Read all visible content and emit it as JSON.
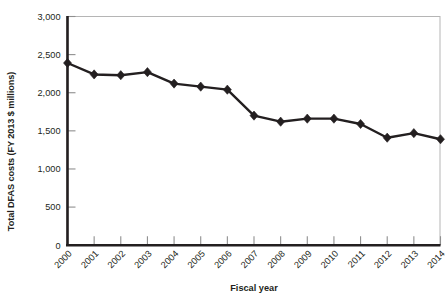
{
  "chart_data": {
    "type": "line",
    "title": "",
    "xlabel": "Fiscal year",
    "ylabel": "Total DFAS costs (FY 2013 $ millions)",
    "categories": [
      "2000",
      "2001",
      "2002",
      "2003",
      "2004",
      "2005",
      "2006",
      "2007",
      "2008",
      "2009",
      "2010",
      "2011",
      "2012",
      "2013",
      "2014"
    ],
    "values": [
      2390,
      2240,
      2230,
      2270,
      2120,
      2080,
      2040,
      1700,
      1620,
      1660,
      1660,
      1590,
      1410,
      1470,
      1390
    ],
    "series": [
      {
        "name": "Total DFAS costs",
        "values": [
          2390,
          2240,
          2230,
          2270,
          2120,
          2080,
          2040,
          1700,
          1620,
          1660,
          1660,
          1590,
          1410,
          1470,
          1390
        ]
      }
    ],
    "ylim": [
      0,
      3000
    ],
    "y_ticks": [
      0,
      500,
      1000,
      1500,
      2000,
      2500,
      3000
    ],
    "y_tick_labels": [
      "0",
      "500",
      "1,000",
      "1,500",
      "2,000",
      "2,500",
      "3,000"
    ],
    "x_tick_labels": [
      "2000",
      "2001",
      "2002",
      "2003",
      "2004",
      "2005",
      "2006",
      "2007",
      "2008",
      "2009",
      "2010",
      "2011",
      "2012",
      "2013",
      "2014"
    ],
    "grid": false,
    "legend": null,
    "legend_position": "none",
    "marker": "diamond",
    "line_color": "#231f20",
    "marker_color": "#231f20",
    "axis_color": "#231f20",
    "frame_color": "#b5b5b5",
    "background": "#ffffff",
    "x_tick_rotation_deg": 45
  }
}
